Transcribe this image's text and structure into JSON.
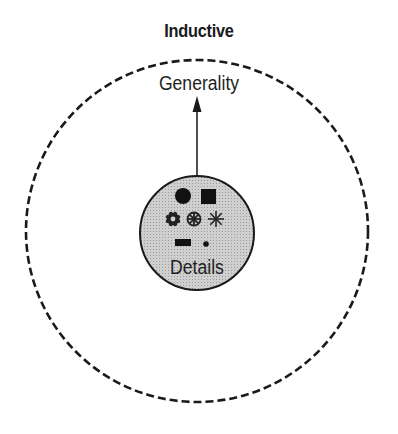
{
  "diagram": {
    "title": "Inductive",
    "outer_label": "Generality",
    "inner_label": "Details",
    "arrow_direction": "up",
    "outer_circle": {
      "style": "dashed",
      "stroke": "#1a1a1a",
      "fill": "#ffffff"
    },
    "inner_circle": {
      "style": "solid",
      "stroke": "#1a1a1a",
      "fill": "#c8c8c8"
    },
    "detail_symbols": [
      "filled-circle",
      "filled-square",
      "flower-ring",
      "snowflake-ring",
      "asterisk",
      "filled-rectangle",
      "small-dot"
    ]
  }
}
